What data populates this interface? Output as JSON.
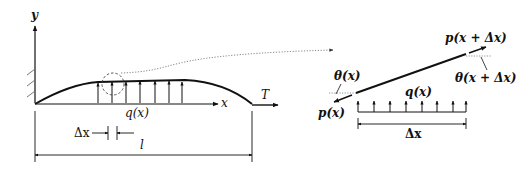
{
  "figure": {
    "left_panel": {
      "name": "string-under-tension",
      "axis_labels": {
        "y": "y",
        "x": "x"
      },
      "tension_label": "T",
      "load_label": "q(x)",
      "element_width_label": "Δx",
      "span_label": "l",
      "load_arrow_count": 7
    },
    "right_panel": {
      "name": "free-body-element",
      "left_force_label": "p(x)",
      "right_force_label": "p(x + Δx)",
      "left_angle_label": "θ(x)",
      "right_angle_label": "θ(x + Δx)",
      "load_label": "q(x)",
      "element_width_label": "Δx",
      "load_arrow_count": 8
    },
    "colors": {
      "stroke": "#111111",
      "dotted": "#888888",
      "background": "#ffffff"
    }
  }
}
